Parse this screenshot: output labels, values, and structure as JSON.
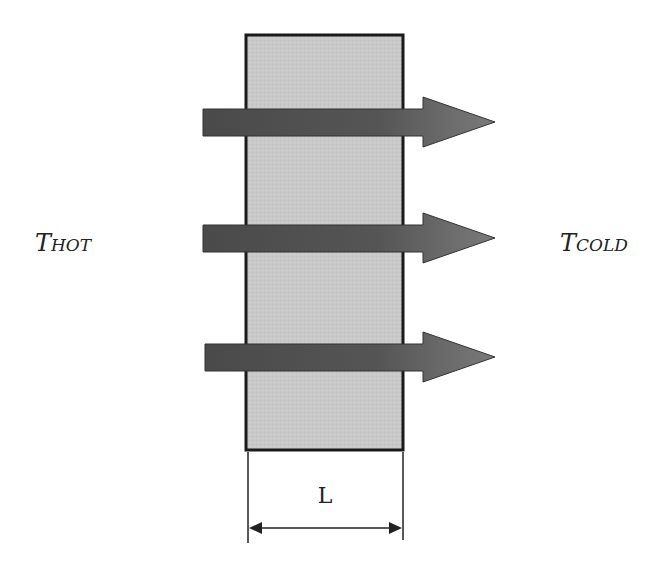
{
  "diagram": {
    "labels": {
      "hot_main": "T",
      "hot_sub": "HOT",
      "cold_main": "T",
      "cold_sub": "COLD",
      "thickness": "L"
    },
    "slab": {
      "x": 246,
      "y": 35,
      "width": 157,
      "height": 415,
      "fill": "#c8c8c8",
      "stroke": "#1a1a1a"
    },
    "arrows": [
      {
        "name": "heat-flow-arrow-1",
        "y": 122
      },
      {
        "name": "heat-flow-arrow-2",
        "y": 238
      },
      {
        "name": "heat-flow-arrow-3",
        "y": 357
      }
    ],
    "colors": {
      "arrow_dark": "#4a4a4a",
      "arrow_light": "#7a7a7a",
      "slab_fill": "#c8c8c8",
      "outline": "#1a1a1a"
    }
  }
}
